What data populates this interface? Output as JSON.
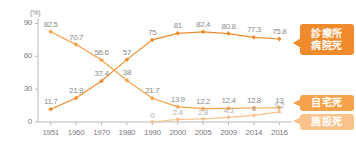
{
  "chart_data": {
    "type": "line",
    "title": "",
    "xlabel": "",
    "ylabel": "(%)",
    "ylim": [
      0,
      95
    ],
    "yticks": [
      "0",
      "30",
      "60",
      "90"
    ],
    "grid": false,
    "legend_position": "right",
    "categories": [
      "1951",
      "1960",
      "1970",
      "1980",
      "1990",
      "2000",
      "2005",
      "2009",
      "2014",
      "2016"
    ],
    "series": [
      {
        "name": "診療所病院死",
        "color": "#ef8b2c",
        "values": [
          11.7,
          21.9,
          37.4,
          57,
          75,
          81,
          82.4,
          80.8,
          77.3,
          75.8
        ],
        "labels": [
          "11.7",
          "21.9",
          "37.4",
          "57",
          "75",
          "81",
          "82.4",
          "80.8",
          "77.3",
          "75.8"
        ]
      },
      {
        "name": "自宅死",
        "color": "#f6a24a",
        "values": [
          82.5,
          70.7,
          56.6,
          38,
          21.7,
          13.9,
          12.2,
          12.4,
          12.8,
          13
        ],
        "labels": [
          "82.5",
          "70.7",
          "56.6",
          "38",
          "21.7",
          "13.9",
          "12.2",
          "12.4",
          "12.8",
          "13"
        ]
      },
      {
        "name": "施設死",
        "color": "#f9c28c",
        "values": [
          null,
          null,
          null,
          null,
          0,
          2.4,
          2.8,
          4.3,
          6,
          9.2
        ],
        "labels": [
          "",
          "",
          "",
          "",
          "0",
          "2.4",
          "2.8",
          "4.3",
          "6",
          "9.2"
        ]
      }
    ]
  },
  "axis": {
    "unit": "(%)"
  },
  "legend": {
    "hospital": {
      "line1": "診療所",
      "line2": "病院死"
    },
    "home": {
      "line1": "自宅死"
    },
    "facility": {
      "line1": "施設死"
    }
  }
}
